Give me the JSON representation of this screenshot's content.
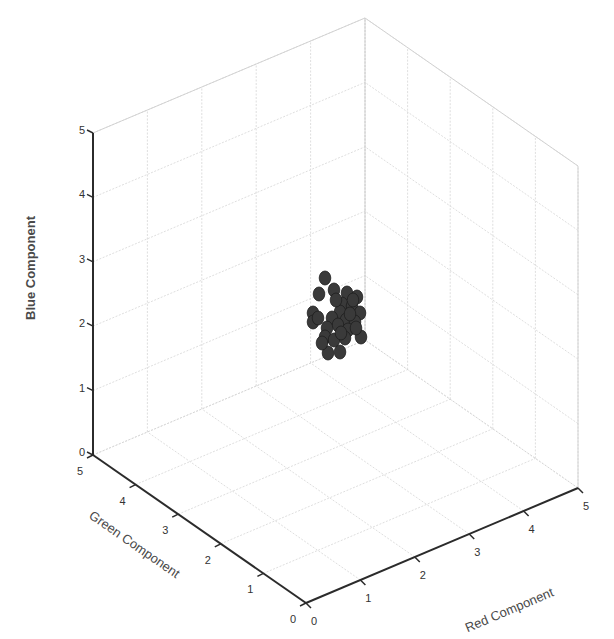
{
  "chart_data": {
    "type": "scatter3d",
    "title": "",
    "xlabel": "Red Component",
    "ylabel": "Green Component",
    "zlabel": "Blue Component",
    "xlim": [
      0,
      5
    ],
    "ylim": [
      0,
      5
    ],
    "zlim": [
      0,
      5
    ],
    "x_ticks": [
      "0",
      "1",
      "2",
      "3",
      "4",
      "5"
    ],
    "y_ticks": [
      "0",
      "1",
      "2",
      "3",
      "4",
      "5"
    ],
    "z_ticks": [
      "0",
      "1",
      "2",
      "3",
      "4",
      "5"
    ],
    "grid": true,
    "legend": null,
    "marker": {
      "shape": "filled-circle",
      "color": "#3a3a3a"
    },
    "points": [
      {
        "r": 2.8,
        "g": 2.9,
        "b": 2.7
      },
      {
        "r": 2.9,
        "g": 2.8,
        "b": 2.5
      },
      {
        "r": 2.6,
        "g": 3.0,
        "b": 2.4
      },
      {
        "r": 3.0,
        "g": 2.6,
        "b": 2.5
      },
      {
        "r": 3.1,
        "g": 2.5,
        "b": 2.4
      },
      {
        "r": 2.9,
        "g": 2.6,
        "b": 2.3
      },
      {
        "r": 3.0,
        "g": 2.5,
        "b": 2.3
      },
      {
        "r": 2.9,
        "g": 2.6,
        "b": 2.2
      },
      {
        "r": 3.1,
        "g": 2.4,
        "b": 2.2
      },
      {
        "r": 2.5,
        "g": 2.9,
        "b": 2.1
      },
      {
        "r": 2.7,
        "g": 2.6,
        "b": 2.1
      },
      {
        "r": 2.9,
        "g": 2.5,
        "b": 2.1
      },
      {
        "r": 3.0,
        "g": 2.4,
        "b": 2.0
      },
      {
        "r": 2.8,
        "g": 2.6,
        "b": 2.0
      },
      {
        "r": 2.5,
        "g": 2.9,
        "b": 2.0
      },
      {
        "r": 2.9,
        "g": 2.4,
        "b": 1.9
      },
      {
        "r": 2.7,
        "g": 2.6,
        "b": 1.9
      },
      {
        "r": 3.1,
        "g": 2.3,
        "b": 1.8
      },
      {
        "r": 2.6,
        "g": 2.6,
        "b": 1.8
      },
      {
        "r": 2.7,
        "g": 2.5,
        "b": 1.7
      },
      {
        "r": 2.9,
        "g": 2.4,
        "b": 1.8
      },
      {
        "r": 2.6,
        "g": 2.5,
        "b": 1.5
      },
      {
        "r": 2.8,
        "g": 2.4,
        "b": 1.5
      },
      {
        "r": 2.5,
        "g": 2.8,
        "b": 2.0
      },
      {
        "r": 3.0,
        "g": 2.5,
        "b": 2.2
      },
      {
        "r": 2.8,
        "g": 2.7,
        "b": 2.4
      },
      {
        "r": 3.1,
        "g": 2.4,
        "b": 1.9
      },
      {
        "r": 2.9,
        "g": 2.5,
        "b": 1.9
      },
      {
        "r": 2.6,
        "g": 2.7,
        "b": 1.7
      },
      {
        "r": 3.0,
        "g": 2.6,
        "b": 2.4
      }
    ],
    "screen_points": [
      [
        325,
        278
      ],
      [
        334,
        290
      ],
      [
        319,
        294
      ],
      [
        347,
        293
      ],
      [
        357,
        297
      ],
      [
        342,
        304
      ],
      [
        352,
        306
      ],
      [
        340,
        312
      ],
      [
        360,
        313
      ],
      [
        313,
        313
      ],
      [
        332,
        318
      ],
      [
        346,
        320
      ],
      [
        355,
        322
      ],
      [
        338,
        325
      ],
      [
        313,
        322
      ],
      [
        348,
        330
      ],
      [
        327,
        328
      ],
      [
        361,
        337
      ],
      [
        325,
        337
      ],
      [
        334,
        340
      ],
      [
        345,
        338
      ],
      [
        328,
        353
      ],
      [
        340,
        352
      ],
      [
        318,
        318
      ],
      [
        350,
        314
      ],
      [
        336,
        300
      ],
      [
        356,
        328
      ],
      [
        341,
        333
      ],
      [
        322,
        343
      ],
      [
        353,
        300
      ]
    ]
  }
}
